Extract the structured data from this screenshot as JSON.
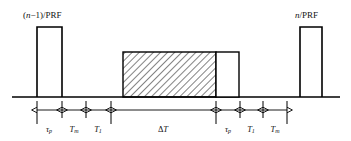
{
  "figure": {
    "type": "radar-prf-timing-waveform",
    "pulse_labels": {
      "left": "(n−1)/PRF",
      "right": "n/PRF"
    },
    "segments": [
      {
        "id": "tau-p-left",
        "label": "τ",
        "sub": "p",
        "x_start": 37,
        "x_end": 62
      },
      {
        "id": "t-m-left",
        "label": "T",
        "sub": "m",
        "x_start": 62,
        "x_end": 86
      },
      {
        "id": "t-1-left",
        "label": "T",
        "sub": "1",
        "x_start": 86,
        "x_end": 111
      },
      {
        "id": "delta-t",
        "label": "ΔT",
        "sub": "",
        "x_start": 111,
        "x_end": 216
      },
      {
        "id": "tau-p-right",
        "label": "τ",
        "sub": "p",
        "x_start": 216,
        "x_end": 240
      },
      {
        "id": "t-1-right",
        "label": "T",
        "sub": "1",
        "x_start": 240,
        "x_end": 263
      },
      {
        "id": "t-m-right",
        "label": "T",
        "sub": "m",
        "x_start": 263,
        "x_end": 287
      }
    ],
    "waveform": {
      "baseline_y": 97,
      "pulse_top_y": 27,
      "box_top_y": 52,
      "axis_start_x": 12,
      "axis_end_x": 340,
      "pulses": [
        {
          "id": "pulse-left",
          "x_start": 37,
          "x_end": 62,
          "filled": false
        },
        {
          "id": "pulse-right",
          "x_start": 300,
          "x_end": 322,
          "filled": false
        }
      ],
      "boxes": [
        {
          "id": "hatched-box",
          "x_start": 123,
          "x_end": 216,
          "hatched": true
        },
        {
          "id": "open-box",
          "x_start": 216,
          "x_end": 239,
          "hatched": false
        }
      ],
      "measure_axis_y": 110,
      "tick_positions": [
        37,
        62,
        86,
        111,
        216,
        240,
        263,
        287
      ],
      "cross_marks": [
        62,
        86,
        111,
        216,
        240,
        263
      ]
    },
    "colors": {
      "line": "#000000",
      "hatch": "#1a1a1a",
      "background": "#ffffff"
    }
  }
}
